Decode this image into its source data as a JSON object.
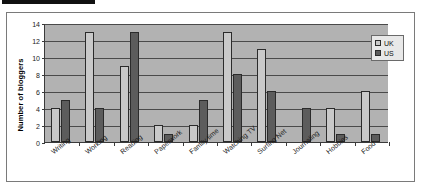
{
  "chart_data": {
    "type": "bar",
    "title": "",
    "xlabel": "",
    "ylabel": "Number of bloggers",
    "ylim": [
      0,
      14
    ],
    "yticks": [
      0,
      2,
      4,
      6,
      8,
      10,
      12,
      14
    ],
    "grid": true,
    "legend_position": "top-right",
    "categories": [
      "Writing",
      "Working",
      "Reading",
      "Paperwork",
      "Family time",
      "Watching TV",
      "Surfing Net",
      "Journaling",
      "Hobbies",
      "Food"
    ],
    "series": [
      {
        "name": "UK",
        "color": "#c9c9c9",
        "values": [
          4,
          13,
          9,
          2,
          2,
          13,
          11,
          0,
          4,
          6
        ]
      },
      {
        "name": "US",
        "color": "#5c5c5c",
        "values": [
          5,
          4,
          13,
          1,
          5,
          8,
          6,
          4,
          1,
          1
        ]
      }
    ]
  },
  "legend": {
    "items": [
      {
        "label": "UK",
        "swatch": "uk"
      },
      {
        "label": "US",
        "swatch": "us"
      }
    ]
  },
  "colors": {
    "plot_background": "#b2b2b2",
    "gridline": "#4a4a4a",
    "axis": "#3a3a3a",
    "uk_bar": "#c9c9c9",
    "us_bar": "#5c5c5c",
    "marker_bar": "#111111"
  }
}
